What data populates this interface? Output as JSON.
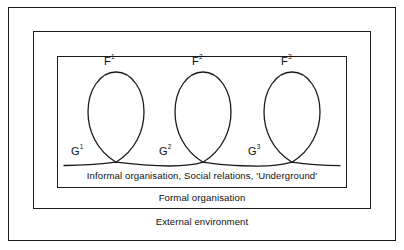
{
  "diagram": {
    "layers": {
      "external": {
        "label": "External environment"
      },
      "formal": {
        "label": "Formal organisation"
      },
      "informal": {
        "label": "Informal organisation, Social relations, 'Underground'"
      }
    },
    "loops": [
      {
        "top_label": "F",
        "top_sup": "1",
        "bottom_label": "G",
        "bottom_sup": "1",
        "center_x": 116,
        "top_y": 70,
        "cross_y": 162
      },
      {
        "top_label": "F",
        "top_sup": "2",
        "bottom_label": "G",
        "bottom_sup": "2",
        "center_x": 203,
        "top_y": 70,
        "cross_y": 162
      },
      {
        "top_label": "G",
        "top_sup": "3",
        "bottom_label": "G",
        "bottom_sup": "3",
        "center_x": 292,
        "top_y": 70,
        "cross_y": 162
      }
    ],
    "node_labels": [
      {
        "name": "f1",
        "text": "F",
        "sup": "1",
        "x": 104,
        "y": 55
      },
      {
        "name": "f2",
        "text": "F",
        "sup": "2",
        "x": 192,
        "y": 55
      },
      {
        "name": "f3",
        "text": "F",
        "sup": "3",
        "x": 281,
        "y": 55
      },
      {
        "name": "g1",
        "text": "G",
        "sup": "1",
        "x": 71,
        "y": 145
      },
      {
        "name": "g2",
        "text": "G",
        "sup": "2",
        "x": 159,
        "y": 145
      },
      {
        "name": "g3",
        "text": "G",
        "sup": "3",
        "x": 248,
        "y": 145
      }
    ],
    "colors": {
      "stroke": "#1a1a1a",
      "text": "#111111",
      "background": "#ffffff"
    }
  }
}
